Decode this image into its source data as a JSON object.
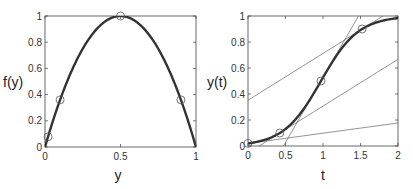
{
  "chart_data": [
    {
      "type": "line",
      "title": "",
      "xlabel": "y",
      "ylabel": "f(y)",
      "xlim": [
        0,
        1
      ],
      "ylim": [
        0,
        1
      ],
      "xticks": [
        0,
        0.5,
        1
      ],
      "xtick_labels": [
        "0",
        "0.5",
        "1"
      ],
      "yticks": [
        0,
        0.2,
        0.4,
        0.6,
        0.8,
        1
      ],
      "ytick_labels": [
        "0",
        "0.2",
        "0.4",
        "0.6",
        "0.8",
        "1"
      ],
      "grid": false,
      "legend": null,
      "series": [
        {
          "name": "f(y) = 4y(1-y)",
          "style": "thick-line",
          "x": [
            0,
            0.05,
            0.1,
            0.15,
            0.2,
            0.25,
            0.3,
            0.35,
            0.4,
            0.45,
            0.5,
            0.55,
            0.6,
            0.65,
            0.7,
            0.75,
            0.8,
            0.85,
            0.9,
            0.95,
            1
          ],
          "y": [
            0,
            0.19,
            0.36,
            0.51,
            0.64,
            0.75,
            0.84,
            0.91,
            0.96,
            0.99,
            1,
            0.99,
            0.96,
            0.91,
            0.84,
            0.75,
            0.64,
            0.51,
            0.36,
            0.19,
            0
          ]
        },
        {
          "name": "markers",
          "style": "circle-markers",
          "x": [
            0.02,
            0.1,
            0.5,
            0.9
          ],
          "y": [
            0.078,
            0.36,
            1,
            0.36
          ]
        }
      ]
    },
    {
      "type": "line",
      "title": "",
      "xlabel": "t",
      "ylabel": "y(t)",
      "xlim": [
        0,
        2
      ],
      "ylim": [
        0,
        1
      ],
      "xticks": [
        0,
        0.5,
        1,
        1.5,
        2
      ],
      "xtick_labels": [
        "0",
        "0.5",
        "1",
        "1.5",
        "2"
      ],
      "yticks": [
        0,
        0.2,
        0.4,
        0.6,
        0.8,
        1
      ],
      "ytick_labels": [
        "0",
        "0.2",
        "0.4",
        "0.6",
        "0.8",
        "1"
      ],
      "grid": false,
      "legend": null,
      "series": [
        {
          "name": "y(t) logistic",
          "style": "thick-line",
          "x": [
            0,
            0.1,
            0.2,
            0.3,
            0.4,
            0.5,
            0.6,
            0.7,
            0.8,
            0.9,
            1.0,
            1.1,
            1.2,
            1.3,
            1.4,
            1.5,
            1.6,
            1.7,
            1.8,
            1.9,
            2.0
          ],
          "y": [
            0.02,
            0.03,
            0.044,
            0.064,
            0.094,
            0.134,
            0.19,
            0.26,
            0.34,
            0.43,
            0.527,
            0.62,
            0.71,
            0.78,
            0.84,
            0.89,
            0.92,
            0.945,
            0.96,
            0.973,
            0.982
          ]
        },
        {
          "name": "markers",
          "style": "circle-markers",
          "x": [
            0,
            0.424,
            0.973,
            1.522
          ],
          "y": [
            0.02,
            0.1,
            0.5,
            0.9
          ]
        },
        {
          "name": "tangent at y=0.02",
          "style": "thin-line",
          "x": [
            0,
            2
          ],
          "y": [
            0.02,
            0.177
          ]
        },
        {
          "name": "tangent at y=0.1",
          "style": "thin-line",
          "x": [
            0,
            2
          ],
          "y": [
            -0.053,
            0.667
          ]
        },
        {
          "name": "tangent at y=0.5",
          "style": "thin-line",
          "x": [
            0.473,
            1.473
          ],
          "y": [
            0,
            1
          ]
        },
        {
          "name": "tangent at y=0.9",
          "style": "thin-line",
          "x": [
            0,
            1.8
          ],
          "y": [
            0.352,
            1
          ]
        }
      ]
    }
  ],
  "plots": {
    "left": {
      "xlabel": "y",
      "ylabel": "f(y)"
    },
    "right": {
      "xlabel": "t",
      "ylabel": "y(t)"
    }
  }
}
